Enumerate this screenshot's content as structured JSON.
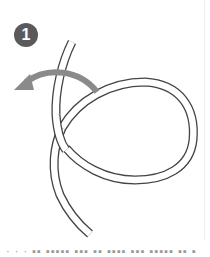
{
  "step": {
    "number": "1",
    "badge_color": "#5a5a5a"
  },
  "illustration": {
    "subject": "rope-loop-knot-step",
    "rope_outline_color": "#444444",
    "rope_fill_color": "#ffffff",
    "arrow_color": "#8a8a8a",
    "arrow_direction": "left"
  },
  "caption": {
    "text": "· · ·  ▪▪ ▪▪▪▪▪ ▪▪▪ ▪▪ ▪▪▪▪  ▪▪▪ ▪▪▪▪▪ ▪▪ ▪"
  }
}
